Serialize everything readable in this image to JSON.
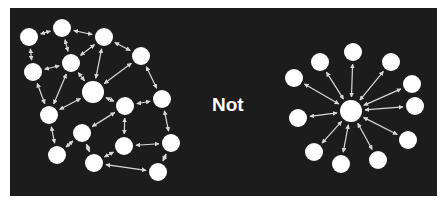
{
  "label": "Not",
  "colors": {
    "background": "#1c1c1c",
    "node": "#ffffff",
    "edge": "#d8d8d8",
    "page": "#ffffff"
  },
  "left_graph": {
    "description": "decentralized mesh network",
    "nodes": [
      {
        "id": "A",
        "x": 29,
        "y": 37,
        "r": 9
      },
      {
        "id": "B",
        "x": 62,
        "y": 28,
        "r": 9
      },
      {
        "id": "C",
        "x": 104,
        "y": 37,
        "r": 9
      },
      {
        "id": "D",
        "x": 33,
        "y": 72,
        "r": 9
      },
      {
        "id": "E",
        "x": 71,
        "y": 63,
        "r": 9
      },
      {
        "id": "F",
        "x": 93,
        "y": 92,
        "r": 11
      },
      {
        "id": "G",
        "x": 141,
        "y": 56,
        "r": 9
      },
      {
        "id": "H",
        "x": 49,
        "y": 115,
        "r": 9
      },
      {
        "id": "I",
        "x": 125,
        "y": 106,
        "r": 9
      },
      {
        "id": "J",
        "x": 162,
        "y": 99,
        "r": 9
      },
      {
        "id": "K",
        "x": 82,
        "y": 133,
        "r": 9
      },
      {
        "id": "L",
        "x": 57,
        "y": 155,
        "r": 9
      },
      {
        "id": "M",
        "x": 94,
        "y": 163,
        "r": 9
      },
      {
        "id": "N",
        "x": 124,
        "y": 146,
        "r": 9
      },
      {
        "id": "O",
        "x": 171,
        "y": 143,
        "r": 9
      },
      {
        "id": "P",
        "x": 158,
        "y": 172,
        "r": 9
      }
    ],
    "edges": [
      [
        "A",
        "B"
      ],
      [
        "B",
        "C"
      ],
      [
        "A",
        "D"
      ],
      [
        "B",
        "E"
      ],
      [
        "D",
        "E"
      ],
      [
        "C",
        "E"
      ],
      [
        "C",
        "F"
      ],
      [
        "E",
        "F"
      ],
      [
        "G",
        "F"
      ],
      [
        "C",
        "G"
      ],
      [
        "G",
        "J"
      ],
      [
        "D",
        "H"
      ],
      [
        "E",
        "H"
      ],
      [
        "F",
        "H"
      ],
      [
        "F",
        "I"
      ],
      [
        "I",
        "J"
      ],
      [
        "I",
        "K"
      ],
      [
        "H",
        "L"
      ],
      [
        "K",
        "L"
      ],
      [
        "K",
        "M"
      ],
      [
        "I",
        "N"
      ],
      [
        "M",
        "N"
      ],
      [
        "N",
        "O"
      ],
      [
        "J",
        "O"
      ],
      [
        "O",
        "P"
      ],
      [
        "M",
        "P"
      ]
    ]
  },
  "right_graph": {
    "description": "centralized hub-and-spoke network",
    "center": {
      "id": "hub",
      "x": 351,
      "y": 111,
      "r": 11
    },
    "nodes": [
      {
        "id": "R1",
        "x": 353,
        "y": 52,
        "r": 9
      },
      {
        "id": "R2",
        "x": 320,
        "y": 62,
        "r": 9
      },
      {
        "id": "R3",
        "x": 391,
        "y": 62,
        "r": 9
      },
      {
        "id": "R4",
        "x": 294,
        "y": 78,
        "r": 9
      },
      {
        "id": "R5",
        "x": 412,
        "y": 84,
        "r": 9
      },
      {
        "id": "R6",
        "x": 415,
        "y": 106,
        "r": 9
      },
      {
        "id": "R7",
        "x": 298,
        "y": 118,
        "r": 9
      },
      {
        "id": "R8",
        "x": 408,
        "y": 140,
        "r": 9
      },
      {
        "id": "R9",
        "x": 314,
        "y": 152,
        "r": 9
      },
      {
        "id": "R10",
        "x": 341,
        "y": 164,
        "r": 9
      },
      {
        "id": "R11",
        "x": 378,
        "y": 160,
        "r": 9
      }
    ]
  }
}
